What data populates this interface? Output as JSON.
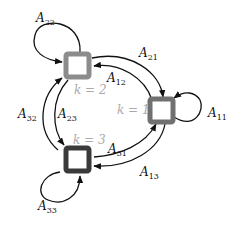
{
  "diagram": {
    "title": "",
    "states": [
      {
        "id": "1",
        "label": "k = 1",
        "color": "#707070"
      },
      {
        "id": "2",
        "label": "k = 2",
        "color": "#8c8c8c"
      },
      {
        "id": "3",
        "label": "k = 3",
        "color": "#3a3a3a"
      }
    ],
    "transitions": [
      {
        "id": "A11",
        "from": "1",
        "to": "1",
        "label": "A",
        "sub": "11"
      },
      {
        "id": "A22",
        "from": "2",
        "to": "2",
        "label": "A",
        "sub": "22"
      },
      {
        "id": "A33",
        "from": "3",
        "to": "3",
        "label": "A",
        "sub": "33"
      },
      {
        "id": "A21",
        "from": "2",
        "to": "1",
        "label": "A",
        "sub": "21"
      },
      {
        "id": "A12",
        "from": "1",
        "to": "2",
        "label": "A",
        "sub": "12"
      },
      {
        "id": "A31",
        "from": "3",
        "to": "1",
        "label": "A",
        "sub": "31"
      },
      {
        "id": "A13",
        "from": "1",
        "to": "3",
        "label": "A",
        "sub": "13"
      },
      {
        "id": "A32",
        "from": "3",
        "to": "2",
        "label": "A",
        "sub": "32"
      },
      {
        "id": "A23",
        "from": "2",
        "to": "3",
        "label": "A",
        "sub": "23"
      }
    ]
  }
}
